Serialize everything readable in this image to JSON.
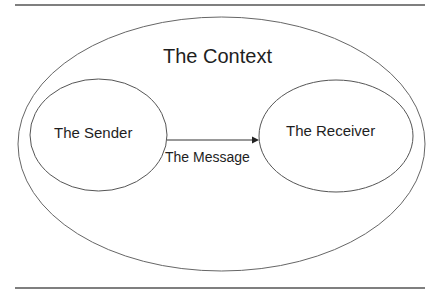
{
  "diagram": {
    "context_label": "The Context",
    "sender_label": "The Sender",
    "receiver_label": "The Receiver",
    "message_label": "The Message",
    "line_color": "#555555"
  }
}
